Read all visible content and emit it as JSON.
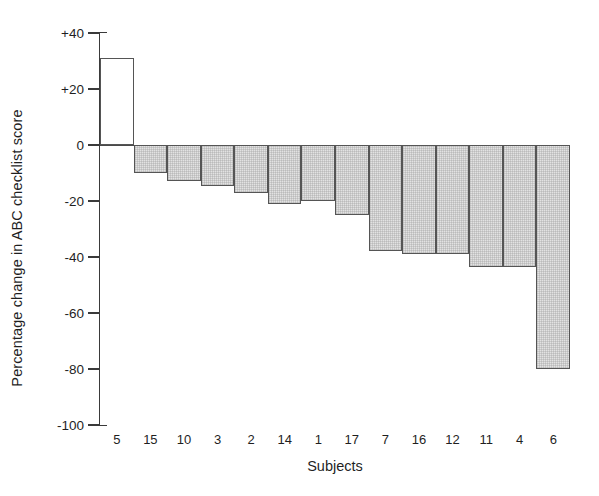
{
  "chart_data": {
    "type": "bar",
    "title": "",
    "xlabel": "Subjects",
    "ylabel": "Percentage change in ABC checklist score",
    "categories": [
      "5",
      "15",
      "10",
      "3",
      "2",
      "14",
      "1",
      "17",
      "7",
      "16",
      "12",
      "11",
      "4",
      "6"
    ],
    "values": [
      31,
      -10,
      -13,
      -14.5,
      -17,
      -21,
      -20,
      -25,
      -38,
      -39,
      -39,
      -43.5,
      -43.5,
      -80
    ],
    "ylim": [
      -100,
      40
    ],
    "xlim_note": "categorical, 14 contiguous bars",
    "yticks": [
      40,
      20,
      0,
      -20,
      -40,
      -60,
      -80,
      -100
    ],
    "yticklabels": [
      "+40",
      "+20",
      "0",
      "-20",
      "-40",
      "-60",
      "-80",
      "-100"
    ],
    "grid": false,
    "legend": null,
    "bar_style": {
      "positive_fill": "#ffffff",
      "negative_fill": "#e2e2e2",
      "edge_color": "#555555"
    },
    "axis_color": "#3a3a3a",
    "text_color": "#1f1f1f"
  }
}
